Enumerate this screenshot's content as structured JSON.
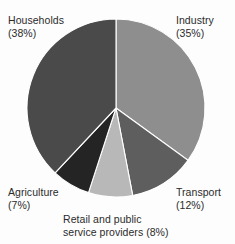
{
  "chart_data": {
    "type": "pie",
    "title": "",
    "subtitle": "",
    "xlabel": "",
    "ylabel": "",
    "legend_position": "none",
    "grid": false,
    "units": "percent",
    "total": 100,
    "start_angle_deg": 0,
    "direction": "clockwise",
    "categories": [
      "Industry",
      "Transport",
      "Retail and public service providers",
      "Agriculture",
      "Households"
    ],
    "values": [
      35,
      12,
      8,
      7,
      38
    ],
    "slices": [
      {
        "name": "Industry",
        "value": 35,
        "value_text": "(35%)",
        "color": "#8e8e8e",
        "start_deg": 0,
        "end_deg": 126
      },
      {
        "name": "Transport",
        "value": 12,
        "value_text": "(12%)",
        "color": "#5e5e5e",
        "start_deg": 126,
        "end_deg": 169.2
      },
      {
        "name": "Retail and public service providers",
        "value": 8,
        "value_text": "(8%)",
        "color": "#b8b8b8",
        "start_deg": 169.2,
        "end_deg": 198
      },
      {
        "name": "Agriculture",
        "value": 7,
        "value_text": "(7%)",
        "color": "#242424",
        "start_deg": 198,
        "end_deg": 223.2
      },
      {
        "name": "Households",
        "value": 38,
        "value_text": "(38%)",
        "color": "#4a4a4a",
        "start_deg": 223.2,
        "end_deg": 360
      }
    ],
    "geometry": {
      "center_x": 116,
      "center_y": 108,
      "radius": 89
    }
  },
  "labels": {
    "households": {
      "line1": "Households",
      "line2": "(38%)"
    },
    "industry": {
      "line1": "Industry",
      "line2": "(35%)"
    },
    "transport": {
      "line1": "Transport",
      "line2": "(12%)"
    },
    "agriculture": {
      "line1": "Agriculture",
      "line2": "(7%)"
    },
    "retail": {
      "line1": "Retail and public",
      "line2": "service providers (8%)"
    }
  }
}
